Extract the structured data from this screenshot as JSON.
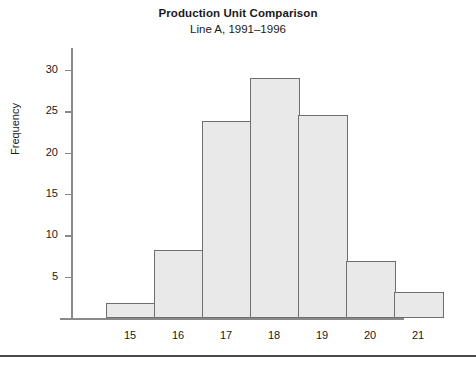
{
  "chart_data": {
    "type": "bar",
    "title": "Production Unit Comparison",
    "subtitle": "Line A, 1991–1996",
    "xlabel": "",
    "ylabel": "Frequency",
    "categories": [
      "15",
      "16",
      "17",
      "18",
      "19",
      "20",
      "21"
    ],
    "values": [
      1.8,
      8.2,
      23.8,
      29.0,
      24.5,
      6.9,
      3.1
    ],
    "ylim": [
      0,
      31.5
    ],
    "y_ticks": [
      "5",
      "10",
      "15",
      "20",
      "25",
      "30"
    ],
    "y_tick_values": [
      5,
      10,
      15,
      20,
      25,
      30
    ],
    "grid": false,
    "legend": "none",
    "bar_fill_color": "#e9e9e9",
    "bar_border_color": "#6e6e6e",
    "axis_color": "#8a8a8a",
    "background_color": "#ffffff"
  }
}
